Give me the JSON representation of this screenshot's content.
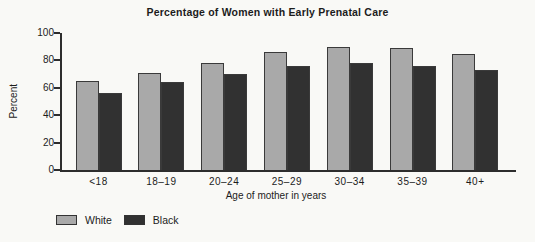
{
  "chart_data": {
    "type": "bar",
    "title": "Percentage of Women with Early Prenatal Care",
    "categories": [
      "<18",
      "18–19",
      "20–24",
      "25–29",
      "30–34",
      "35–39",
      "40+"
    ],
    "series": [
      {
        "name": "White",
        "color": "#a9a9a9",
        "values": [
          65,
          71,
          78,
          86,
          90,
          89,
          85
        ]
      },
      {
        "name": "Black",
        "color": "#313131",
        "values": [
          56,
          64,
          70,
          76,
          78,
          76,
          73
        ]
      }
    ],
    "xlabel": "Age of mother in years",
    "ylabel": "Percent",
    "ylim": [
      0,
      100
    ],
    "yticks": [
      0,
      20,
      40,
      60,
      80,
      100
    ],
    "grid": false,
    "legend_position": "bottom-left",
    "axis_color": "#2d2d2d",
    "background_color": "#f9f9f6"
  }
}
